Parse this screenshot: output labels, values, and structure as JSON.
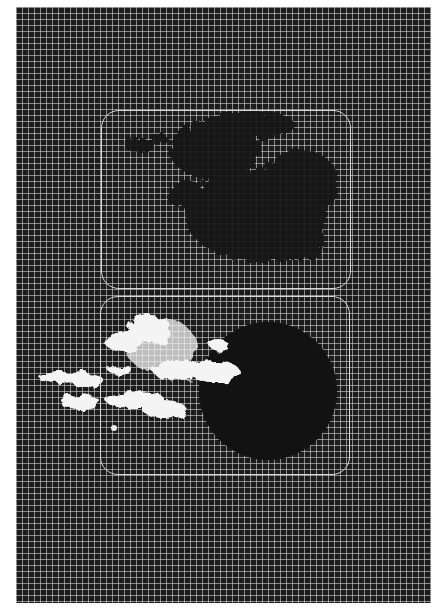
{
  "figure": {
    "background_color": "#1c1c1c",
    "grid_color": "#e1e1e1",
    "grid_spacing_px": 6,
    "panels": [
      {
        "id": "top-panel",
        "description": "dark irregular cloud mass over grid",
        "box": {
          "x": 101,
          "y": 110,
          "w": 250,
          "h": 179
        },
        "feature_color": "#141414"
      },
      {
        "id": "bottom-panel",
        "description": "bright white cloud streak left of dark circular disk",
        "box": {
          "x": 100,
          "y": 296,
          "w": 250,
          "h": 179
        },
        "disk": {
          "cx": 268,
          "cy": 391,
          "r": 69,
          "color": "#111111"
        },
        "cloud_color": "#f4f4f4"
      }
    ]
  }
}
